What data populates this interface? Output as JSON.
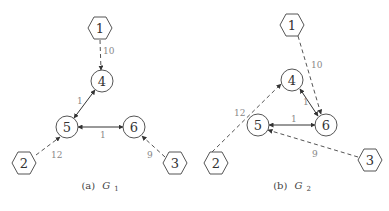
{
  "figures": [
    {
      "id": "g1",
      "caption_prefix": "(a)",
      "caption_symbol": "G",
      "caption_sub": "1",
      "nodes": [
        {
          "id": "1",
          "label": "1",
          "shape": "hexagon",
          "x": 100,
          "y": 28
        },
        {
          "id": "4",
          "label": "4",
          "shape": "circle",
          "x": 102,
          "y": 81
        },
        {
          "id": "5",
          "label": "5",
          "shape": "circle",
          "x": 67,
          "y": 127
        },
        {
          "id": "6",
          "label": "6",
          "shape": "circle",
          "x": 134,
          "y": 127
        },
        {
          "id": "2",
          "label": "2",
          "shape": "hexagon",
          "x": 24,
          "y": 163
        },
        {
          "id": "3",
          "label": "3",
          "shape": "hexagon",
          "x": 175,
          "y": 163
        }
      ],
      "edges": [
        {
          "from": "1",
          "to": "4",
          "weight": "10",
          "style": "dashed",
          "directed": "forward"
        },
        {
          "from": "4",
          "to": "5",
          "weight": "1",
          "style": "solid",
          "directed": "both"
        },
        {
          "from": "5",
          "to": "6",
          "weight": "1",
          "style": "solid",
          "directed": "both"
        },
        {
          "from": "2",
          "to": "5",
          "weight": "12",
          "style": "dashed",
          "directed": "forward"
        },
        {
          "from": "3",
          "to": "6",
          "weight": "9",
          "style": "dashed",
          "directed": "forward"
        }
      ]
    },
    {
      "id": "g2",
      "caption_prefix": "(b)",
      "caption_symbol": "G",
      "caption_sub": "2",
      "nodes": [
        {
          "id": "1",
          "label": "1",
          "shape": "hexagon",
          "x": 292,
          "y": 25
        },
        {
          "id": "4",
          "label": "4",
          "shape": "circle",
          "x": 292,
          "y": 80
        },
        {
          "id": "5",
          "label": "5",
          "shape": "circle",
          "x": 258,
          "y": 125
        },
        {
          "id": "6",
          "label": "6",
          "shape": "circle",
          "x": 326,
          "y": 125
        },
        {
          "id": "2",
          "label": "2",
          "shape": "hexagon",
          "x": 216,
          "y": 163
        },
        {
          "id": "3",
          "label": "3",
          "shape": "hexagon",
          "x": 370,
          "y": 160
        }
      ],
      "edges": [
        {
          "from": "1",
          "to": "6",
          "weight": "10",
          "style": "dashed",
          "directed": "forward"
        },
        {
          "from": "4",
          "to": "6",
          "weight": "1",
          "style": "solid",
          "directed": "both"
        },
        {
          "from": "5",
          "to": "6",
          "weight": "1",
          "style": "solid",
          "directed": "both"
        },
        {
          "from": "2",
          "to": "4",
          "weight": "12",
          "style": "dashed",
          "directed": "forward"
        },
        {
          "from": "3",
          "to": "5",
          "weight": "9",
          "style": "dashed",
          "directed": "forward"
        }
      ]
    }
  ],
  "labels": {
    "g1": {
      "n1": "1",
      "n2": "2",
      "n3": "3",
      "n4": "4",
      "n5": "5",
      "n6": "6",
      "e14": "10",
      "e45": "1",
      "e56": "1",
      "e25": "12",
      "e36": "9",
      "cap_prefix": "(a)",
      "cap_symbol": "G",
      "cap_sub": "1"
    },
    "g2": {
      "n1": "1",
      "n2": "2",
      "n3": "3",
      "n4": "4",
      "n5": "5",
      "n6": "6",
      "e16": "10",
      "e46": "1",
      "e56": "1",
      "e24": "12",
      "e35": "9",
      "cap_prefix": "(b)",
      "cap_symbol": "G",
      "cap_sub": "2"
    }
  },
  "colors": {
    "node_stroke": "#555555",
    "solid_edge": "#333333",
    "dashed_edge": "#555555",
    "edge_label": "#888888",
    "background": "#ffffff"
  }
}
